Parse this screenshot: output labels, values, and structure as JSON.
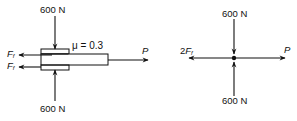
{
  "left_diagram": {
    "top_force": {
      "label": "600 N"
    },
    "bottom_force": {
      "label": "600 N"
    },
    "friction_top": {
      "symbol": "F",
      "subscript": "f"
    },
    "friction_bottom": {
      "symbol": "F",
      "subscript": "f"
    },
    "coefficient": {
      "label": "μ = 0.3"
    },
    "pull_force": {
      "label": "P"
    }
  },
  "right_diagram": {
    "top_force": {
      "label": "600 N"
    },
    "bottom_force": {
      "label": "600 N"
    },
    "left_force": {
      "prefix": "2",
      "symbol": "F",
      "subscript": "f"
    },
    "right_force": {
      "label": "P"
    }
  },
  "colors": {
    "ink": "#111111",
    "background": "#ffffff"
  }
}
